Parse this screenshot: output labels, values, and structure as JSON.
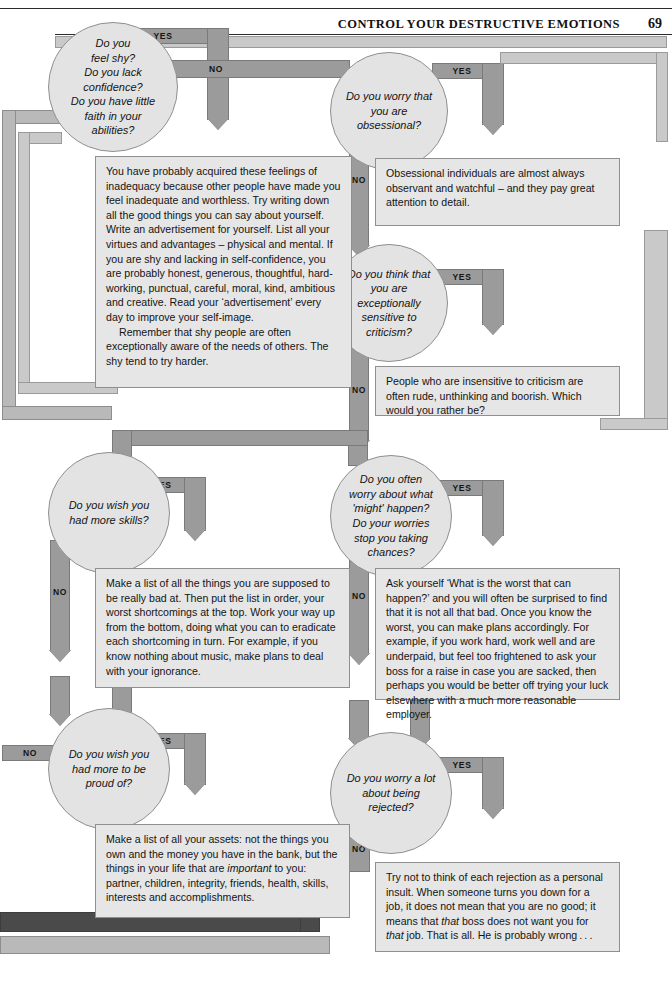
{
  "header": {
    "title": "CONTROL YOUR DESTRUCTIVE EMOTIONS",
    "page_number": "69"
  },
  "labels": {
    "yes": "YES",
    "no": "NO"
  },
  "nodes": [
    {
      "id": "shy",
      "text": "Do you feel shy? Do you lack confidence? Do you have little faith in your abilities?",
      "lines": [
        "Do you",
        "feel shy?",
        "Do you lack",
        "confidence?",
        "Do you have little",
        "faith in your",
        "abilities?"
      ]
    },
    {
      "id": "obsessional",
      "text": "Do you worry that you are obsessional?",
      "lines": [
        "Do you worry that",
        "you are",
        "obsessional?"
      ]
    },
    {
      "id": "criticism",
      "text": "Do you think that you are exceptionally sensitive to criticism?",
      "lines": [
        "Do you think that",
        "you are",
        "exceptionally",
        "sensitive to",
        "criticism?"
      ]
    },
    {
      "id": "skills",
      "text": "Do you wish you had more skills?",
      "lines": [
        "Do you wish you",
        "had more skills?"
      ]
    },
    {
      "id": "worry",
      "text": "Do you often worry about what 'might' happen? Do your worries stop you taking chances?",
      "lines": [
        "Do you often",
        "worry about what",
        "'might' happen?",
        "Do your worries",
        "stop you taking",
        "chances?"
      ]
    },
    {
      "id": "proud",
      "text": "Do you wish you had more to be proud of?",
      "lines": [
        "Do you wish you",
        "had more to be",
        "proud of?"
      ]
    },
    {
      "id": "rejected",
      "text": "Do you worry a lot about being rejected?",
      "lines": [
        "Do you worry a lot",
        "about being",
        "rejected?"
      ]
    }
  ],
  "answers": {
    "shy": {
      "paragraph1": "You have probably acquired these feelings of inadequacy because other people have made you feel inadequate and worthless. Try writing down all the good things you can say about yourself. Write an advertisement for yourself. List all your virtues and advantages – physical and mental. If you are shy and lacking in self-confidence, you are probably honest, generous, thoughtful, hard-working, punctual, careful, moral, kind, ambitious and creative. Read your ‘advertisement’ every day to improve your self-image.",
      "paragraph2": "Remember that shy people are often exceptionally aware of the needs of others. The shy tend to try harder."
    },
    "obsessional": {
      "paragraph1": "Obsessional individuals are almost always observant and watchful – and they pay great attention to detail."
    },
    "criticism": {
      "paragraph1": "People who are insensitive to criticism are often rude, unthinking and boorish. Which would you rather be?"
    },
    "skills": {
      "paragraph1": "Make a list of all the things you are supposed to be really bad at. Then put the list in order, your worst shortcomings at the top. Work your way up from the bottom, doing what you can to eradicate each shortcoming in turn. For example, if you know nothing about music, make plans to deal with your ignorance."
    },
    "worry": {
      "paragraph1": "Ask yourself ‘What is the worst that can happen?’ and you will often be surprised to find that it is not all that bad. Once you know the worst, you can make plans accordingly. For example, if you work hard, work well and are underpaid, but feel too frightened to ask your boss for a raise in case you are sacked, then perhaps you would be better off trying your luck elsewhere with a much more reasonable employer."
    },
    "proud": {
      "paragraph1_a": "Make a list of all your assets: not the things you own and the money you have in the bank, but the things in your life that are ",
      "paragraph1_em": "important",
      "paragraph1_b": " to you: partner, children, integrity, friends, health, skills, interests and accomplishments."
    },
    "rejected": {
      "paragraph1_a": "Try not to think of each rejection as a personal insult. When someone turns you down for a job, it does not mean that you are no good; it means that ",
      "paragraph1_em1": "that",
      "paragraph1_b": " boss does not want you for ",
      "paragraph1_em2": "that",
      "paragraph1_c": " job. That is all. He is probably wrong . . ."
    }
  },
  "colors": {
    "ribbon": "#b9b9b9",
    "ribbon_dark": "#9b9b9b",
    "ribbon_darkest": "#4a4a4a",
    "node_fill": "#e3e3e3",
    "box_fill": "#e6e6e6",
    "stroke": "#8f8f8f",
    "text": "#141414"
  }
}
